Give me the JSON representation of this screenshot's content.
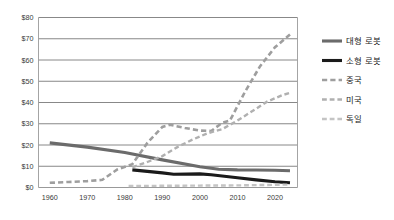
{
  "chart_data": {
    "type": "line",
    "title": "",
    "subtitle": "",
    "xlabel": "",
    "ylabel": "",
    "xlim": [
      1957,
      2026
    ],
    "ylim": [
      0,
      80
    ],
    "grid": "horizontal",
    "legend_position": "right",
    "x_ticks": [
      "1960",
      "1970",
      "1980",
      "1990",
      "2000",
      "2010",
      "2020"
    ],
    "x_tick_values": [
      1960,
      1970,
      1980,
      1990,
      2000,
      2010,
      2020
    ],
    "y_ticks": [
      "$0",
      "$10",
      "$20",
      "$30",
      "$40",
      "$50",
      "$60",
      "$70",
      "$80"
    ],
    "y_tick_values": [
      0,
      10,
      20,
      30,
      40,
      50,
      60,
      70,
      80
    ],
    "series": [
      {
        "name": "대형 로봇",
        "style": "solid",
        "color": "#6b6b6b",
        "width": 3.1,
        "x": [
          1960,
          1970,
          1980,
          1990,
          2000,
          2005,
          2010,
          2015,
          2020,
          2024
        ],
        "values": [
          21.0,
          19.0,
          16.5,
          13.0,
          9.8,
          8.6,
          8.3,
          8.2,
          8.1,
          7.9
        ]
      },
      {
        "name": "소형 로봇",
        "style": "solid",
        "color": "#1a1a1a",
        "width": 3.1,
        "x": [
          1982,
          1990,
          1993,
          2000,
          2003,
          2010,
          2015,
          2020,
          2024
        ],
        "values": [
          8.3,
          6.9,
          6.2,
          6.4,
          6.0,
          4.6,
          3.6,
          2.7,
          2.2
        ]
      },
      {
        "name": "중국",
        "style": "dashed",
        "color": "#9e9e9e",
        "width": 2.6,
        "x": [
          1960,
          1965,
          1970,
          1974,
          1978,
          1982,
          1986,
          1990,
          1992,
          1996,
          2000,
          2003,
          2006,
          2008,
          2012,
          2016,
          2020,
          2024
        ],
        "values": [
          2.2,
          2.6,
          3.0,
          3.6,
          8.5,
          11.0,
          21.0,
          28.5,
          29.5,
          28.0,
          26.8,
          26.6,
          30.5,
          31.5,
          45.0,
          57.0,
          66.0,
          72.0
        ]
      },
      {
        "name": "미국",
        "style": "dashed",
        "color": "#b0b0b0",
        "width": 2.4,
        "x": [
          1982,
          1986,
          1990,
          1994,
          1998,
          2002,
          2006,
          2010,
          2014,
          2018,
          2022,
          2024
        ],
        "values": [
          9.5,
          12.0,
          14.8,
          19.0,
          22.5,
          25.5,
          27.5,
          31.5,
          36.0,
          40.5,
          43.5,
          44.5
        ]
      },
      {
        "name": "독일",
        "style": "dashed",
        "color": "#c4c4c4",
        "width": 2.4,
        "x": [
          1981,
          1990,
          2000,
          2010,
          2018,
          2024
        ],
        "values": [
          0.7,
          0.8,
          0.9,
          1.0,
          1.2,
          1.4
        ]
      }
    ]
  },
  "legend": {
    "items": [
      {
        "label": "대형 로봇",
        "swatch": "solid-thick-gray"
      },
      {
        "label": "소형 로봇",
        "swatch": "solid-thick-black"
      },
      {
        "label": "중국",
        "swatch": "dashed-gray"
      },
      {
        "label": "미국",
        "swatch": "dashed-light-gray"
      },
      {
        "label": "독일",
        "swatch": "dashed-lighter-gray"
      }
    ]
  },
  "colors": {
    "background": "#ffffff",
    "gridline": "#7b7b7b",
    "frame": "#9a9a9a",
    "text": "#3a3a3a"
  }
}
